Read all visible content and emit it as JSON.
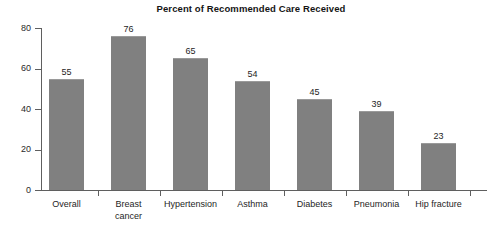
{
  "chart_data": {
    "type": "bar",
    "title": "Percent of Recommended Care Received",
    "xlabel": "",
    "ylabel": "",
    "ylim": [
      0,
      80
    ],
    "yticks": [
      0,
      20,
      40,
      60,
      80
    ],
    "grid": false,
    "legend": "none",
    "bar_color": "#808080",
    "axis_color": "#5f5f5f",
    "background": "#ffffff",
    "categories": [
      "Overall",
      "Breast cancer",
      "Hypertension",
      "Asthma",
      "Diabetes",
      "Pneumonia",
      "Hip fracture"
    ],
    "category_lines": [
      [
        "Overall"
      ],
      [
        "Breast",
        "cancer"
      ],
      [
        "Hypertension"
      ],
      [
        "Asthma"
      ],
      [
        "Diabetes"
      ],
      [
        "Pneumonia"
      ],
      [
        "Hip fracture"
      ]
    ],
    "values": [
      55,
      76,
      65,
      54,
      45,
      39,
      23
    ],
    "value_labels": [
      "55",
      "76",
      "65",
      "54",
      "45",
      "39",
      "23"
    ],
    "ytick_labels": [
      "0",
      "20",
      "40",
      "60",
      "80"
    ]
  }
}
